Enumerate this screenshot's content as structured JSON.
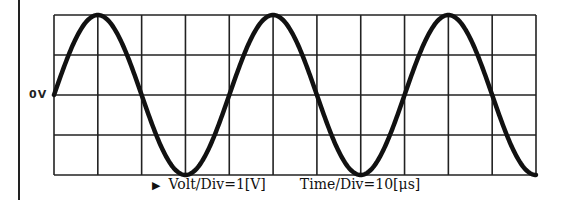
{
  "diagram": {
    "type": "oscilloscope-display",
    "zero_label": "0V",
    "grid": {
      "h_divisions": 11,
      "v_divisions": 4
    },
    "caption": {
      "marker": "▶",
      "volt_div": "Volt/Div=1[V]",
      "time_div": "Time/Div=10[μs]"
    }
  },
  "chart_data": {
    "type": "line",
    "title": "",
    "xlabel": "Time (divisions, 10 μs/div)",
    "ylabel": "Voltage (divisions, 1 V/div)",
    "x_range_div": [
      0,
      11
    ],
    "y_range_div": [
      -2,
      2
    ],
    "grid": true,
    "waveform": "sine",
    "amplitude_V": 2,
    "period_us": 40,
    "start_phase": "0V rising",
    "peaks_div": [
      1,
      5,
      9
    ],
    "troughs_div": [
      3,
      7,
      11
    ],
    "zero_crossings_div": [
      0,
      2,
      4,
      6,
      8,
      10
    ]
  }
}
